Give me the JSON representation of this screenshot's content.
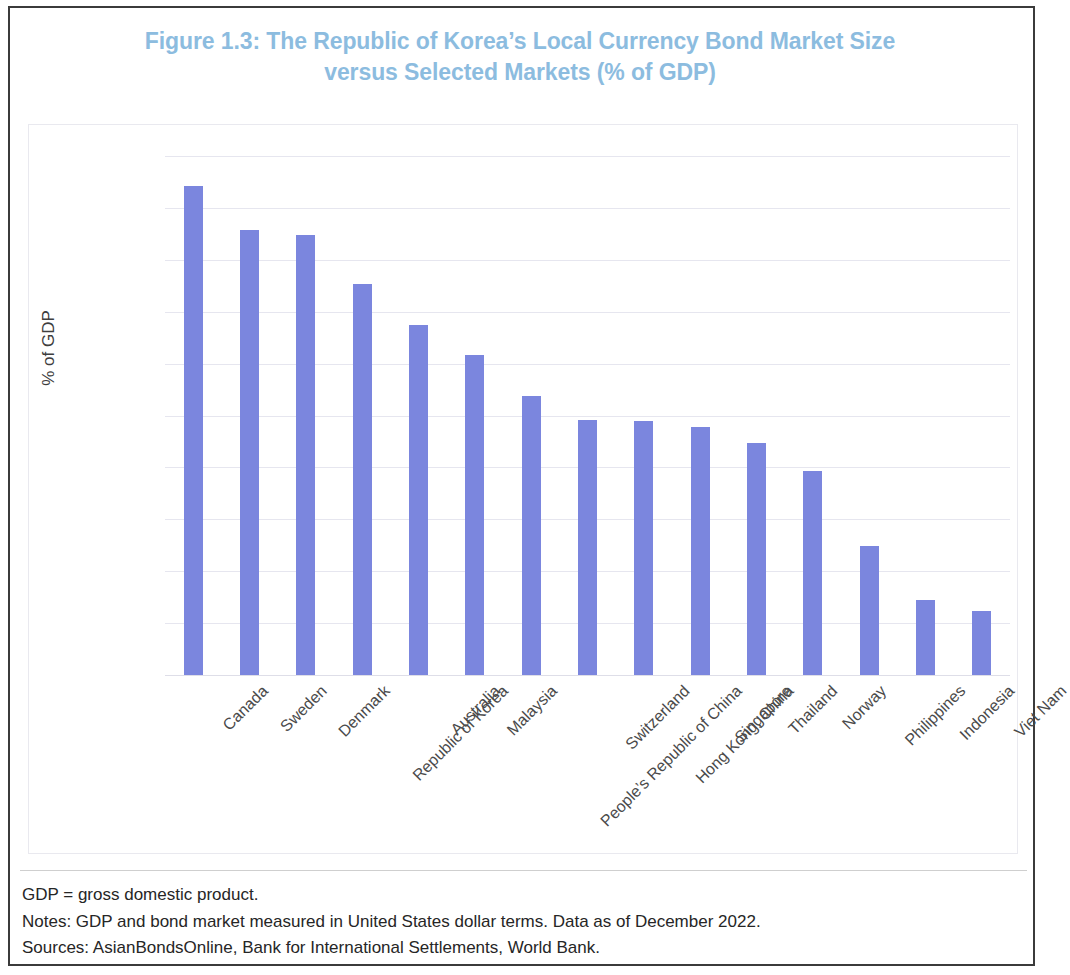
{
  "figure": {
    "title_line1": "Figure 1.3: The Republic of Korea’s Local Currency Bond Market Size",
    "title_line2": "versus Selected Markets (% of GDP)",
    "title_color": "#8cbcdf",
    "bar_color": "#7b86de",
    "border_color": "#3b3b3b",
    "gridline_color": "#e6e6ef"
  },
  "footnotes": {
    "abbreviation": "GDP = gross domestic product.",
    "notes": "Notes: GDP and bond market measured in United States dollar terms. Data as of December 2022.",
    "sources": "Sources: AsianBondsOnline, Bank for International Settlements, World Bank."
  },
  "chart_data": {
    "type": "bar",
    "title": "Figure 1.3: The Republic of Korea’s Local Currency Bond Market Size versus Selected Markets (% of GDP)",
    "xlabel": "",
    "ylabel": "% of GDP",
    "ylim": [
      0,
      200
    ],
    "ytick_step": 20,
    "ytick_labels": [
      "0.00",
      "20.00",
      "40.00",
      "60.00",
      "80.00",
      "100.00",
      "120.00",
      "140.00",
      "160.00",
      "180.00",
      "200.00"
    ],
    "grid": true,
    "legend": false,
    "categories": [
      "Canada",
      "Sweden",
      "Denmark",
      "Republic of Korea",
      "Australia",
      "Malaysia",
      "People’s Republic of China",
      "Switzerland",
      "Hong Kong, China",
      "Singapore",
      "Thailand",
      "Norway",
      "Philippines",
      "Indonesia",
      "Viet Nam"
    ],
    "values": [
      188.6,
      171.3,
      169.4,
      150.7,
      135.0,
      123.2,
      107.6,
      98.4,
      98.0,
      95.6,
      89.3,
      78.5,
      49.7,
      29.0,
      24.7
    ]
  }
}
